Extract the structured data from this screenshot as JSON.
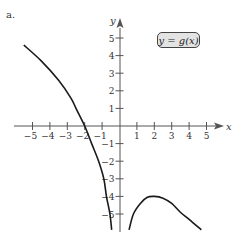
{
  "panel_label": "a.",
  "function_label": "y = g(x)",
  "axes": {
    "x_label": "x",
    "y_label": "y",
    "x_ticks": [
      "-5",
      "-4",
      "-3",
      "-2",
      "-1",
      "1",
      "2",
      "3",
      "4",
      "5"
    ],
    "y_ticks": [
      "5",
      "4",
      "3",
      "2",
      "1",
      "-1",
      "-2",
      "-3",
      "-4",
      "-5"
    ]
  },
  "colors": {
    "curve": "#1a1a1a",
    "axis": "#555555",
    "label_box_fill": "#e3e3e3"
  },
  "chart_data": {
    "type": "line",
    "title": "y = g(x)",
    "xlabel": "x",
    "ylabel": "y",
    "xlim": [
      -5.5,
      5.5
    ],
    "ylim": [
      -6,
      6
    ],
    "grid": false,
    "x_ticks": [
      -5,
      -4,
      -3,
      -2,
      -1,
      1,
      2,
      3,
      4,
      5
    ],
    "y_ticks": [
      -5,
      -4,
      -3,
      -2,
      -1,
      1,
      2,
      3,
      4,
      5
    ],
    "series": [
      {
        "name": "g(x) left branch",
        "points": [
          [
            -5.5,
            4.6
          ],
          [
            -4.5,
            3.7
          ],
          [
            -3.5,
            2.6
          ],
          [
            -2.8,
            1.6
          ],
          [
            -2.5,
            1.0
          ],
          [
            -2.0,
            0.0
          ],
          [
            -1.6,
            -1.0
          ],
          [
            -1.2,
            -2.0
          ],
          [
            -0.9,
            -3.0
          ],
          [
            -0.75,
            -4.0
          ],
          [
            -0.55,
            -5.0
          ],
          [
            -0.45,
            -5.9
          ]
        ]
      },
      {
        "name": "g(x) right branch",
        "points": [
          [
            0.55,
            -5.9
          ],
          [
            0.8,
            -5.0
          ],
          [
            1.2,
            -4.4
          ],
          [
            1.6,
            -4.05
          ],
          [
            2.0,
            -4.0
          ],
          [
            2.5,
            -4.1
          ],
          [
            3.0,
            -4.4
          ],
          [
            3.5,
            -4.9
          ],
          [
            4.0,
            -5.3
          ],
          [
            4.7,
            -5.9
          ]
        ]
      }
    ],
    "annotations": [
      "y = g(x)"
    ]
  }
}
